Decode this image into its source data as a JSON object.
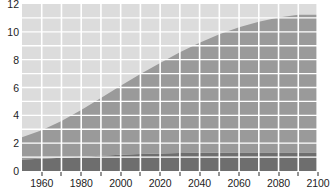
{
  "chart_data": {
    "type": "area",
    "title": "",
    "subtitle": "",
    "xlabel": "",
    "ylabel": "",
    "stacked": true,
    "grid": true,
    "grid_color": "#ffffff",
    "legend_position": "none",
    "background_color": "#ffffff",
    "plot_background_color": "#dcdcdc",
    "xlim": [
      1950,
      2100
    ],
    "ylim": [
      0,
      12
    ],
    "xticks": [
      1960,
      1980,
      2000,
      2020,
      2040,
      2060,
      2080,
      2100
    ],
    "xtick_labels": [
      "1960",
      "1980",
      "2000",
      "2020",
      "2040",
      "2060",
      "2080",
      "2100"
    ],
    "yticks": [
      0,
      2,
      4,
      6,
      8,
      10,
      12
    ],
    "ytick_labels": [
      "0",
      "2",
      "4",
      "6",
      "8",
      "10",
      "12"
    ],
    "x_minor_step": 10,
    "y_minor_step": 1,
    "x": [
      1950,
      1960,
      1970,
      1980,
      1990,
      2000,
      2010,
      2020,
      2030,
      2040,
      2050,
      2060,
      2070,
      2080,
      2090,
      2100
    ],
    "series": [
      {
        "name": "lower-band",
        "color": "#6e6e6e",
        "values": [
          0.82,
          0.88,
          0.95,
          1.03,
          1.1,
          1.17,
          1.22,
          1.26,
          1.29,
          1.31,
          1.32,
          1.33,
          1.33,
          1.33,
          1.33,
          1.33
        ]
      },
      {
        "name": "upper-band",
        "color": "#9a9a9a",
        "values": [
          1.6,
          2.05,
          2.65,
          3.35,
          4.15,
          4.95,
          5.75,
          6.5,
          7.25,
          7.9,
          8.5,
          9.0,
          9.4,
          9.7,
          9.9,
          9.9
        ]
      }
    ],
    "cumulative_totals": [
      2.42,
      2.93,
      3.6,
      4.38,
      5.25,
      6.12,
      6.97,
      7.76,
      8.54,
      9.21,
      9.82,
      10.33,
      10.73,
      11.03,
      11.23,
      11.23
    ],
    "units": "billions",
    "remainder_color": "#dcdcdc"
  },
  "axes": {
    "tick_color": "#2b2b2b",
    "label_color": "#1d1d1d"
  }
}
